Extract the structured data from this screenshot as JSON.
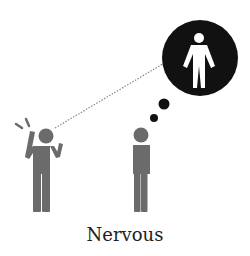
{
  "caption": "Nervous",
  "colors": {
    "figure_gray": "#6b6b6b",
    "bubble_black": "#111111",
    "inner_figure_white": "#ffffff",
    "dotted_line": "#888888",
    "caption_text": "#222222"
  },
  "figures": [
    {
      "name": "nervous-person",
      "pose": "hand-on-head, other hand raised",
      "marks": "stress lines"
    },
    {
      "name": "standing-person",
      "pose": "standing still"
    }
  ],
  "thought_bubble": {
    "content": "person silhouette (white on black)",
    "trail_dots": 2
  },
  "gaze_line": "dotted line from nervous person to thought bubble"
}
